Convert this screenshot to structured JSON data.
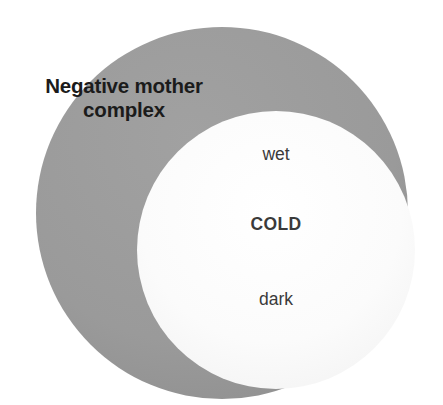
{
  "diagram": {
    "type": "venn-overlap",
    "background_color": "#ffffff",
    "outer_circle": {
      "name": "negative-mother-complex-circle",
      "fill": "#9a9a9a",
      "cx": 222,
      "cy": 213,
      "r": 186,
      "label": "Negative mother complex",
      "label_line_1": "Negative mother",
      "label_line_2": "complex",
      "label_color": "#1b1b1b",
      "label_weight": "bold"
    },
    "inner_circle": {
      "name": "cold-circle",
      "fill": "#fafafa",
      "cx": 276,
      "cy": 250,
      "r": 139,
      "label_color": "#3a3a3a",
      "items": [
        {
          "text": "wet",
          "weight": "normal"
        },
        {
          "text": "COLD",
          "weight": "bold"
        },
        {
          "text": "dark",
          "weight": "normal"
        }
      ]
    }
  }
}
